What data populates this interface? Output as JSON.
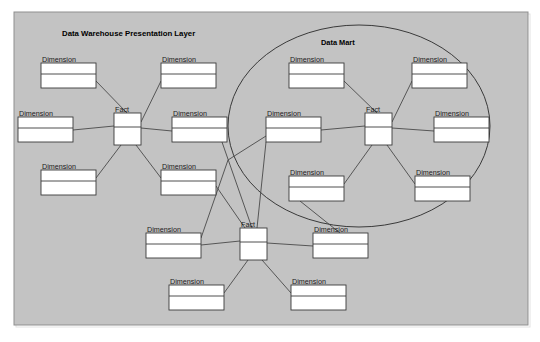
{
  "canvas": {
    "width": 540,
    "height": 342,
    "background": "#ffffff"
  },
  "panel": {
    "name": "data-warehouse-panel",
    "x": 14,
    "y": 12,
    "width": 514,
    "height": 313,
    "fill": "#c3c3c3",
    "stroke": "#8f8f8f"
  },
  "titles": {
    "warehouse": "Data Warehouse Presentation Layer",
    "warehouse_x": 62,
    "warehouse_y": 36,
    "mart": "Data Mart",
    "mart_x": 321,
    "mart_y": 45
  },
  "mart_ellipse": {
    "cx": 359,
    "cy": 126,
    "rx": 131,
    "ry": 101,
    "stroke": "#3a3a3a"
  },
  "entities": [
    {
      "id": "dim-nw-1",
      "label": "Dimension",
      "x": 41,
      "y": 63,
      "w": 55,
      "h": 25,
      "type": "dimension",
      "group": "warehouse-left"
    },
    {
      "id": "dim-nw-2",
      "label": "Dimension",
      "x": 161,
      "y": 63,
      "w": 55,
      "h": 25,
      "type": "dimension",
      "group": "warehouse-left"
    },
    {
      "id": "dim-w-1",
      "label": "Dimension",
      "x": 18,
      "y": 117,
      "w": 55,
      "h": 25,
      "type": "dimension",
      "group": "warehouse-left"
    },
    {
      "id": "dim-e-1",
      "label": "Dimension",
      "x": 172,
      "y": 117,
      "w": 55,
      "h": 25,
      "type": "dimension",
      "group": "warehouse-left"
    },
    {
      "id": "dim-sw-1",
      "label": "Dimension",
      "x": 41,
      "y": 170,
      "w": 55,
      "h": 25,
      "type": "dimension",
      "group": "warehouse-left"
    },
    {
      "id": "dim-sw-2",
      "label": "Dimension",
      "x": 161,
      "y": 170,
      "w": 55,
      "h": 25,
      "type": "dimension",
      "group": "warehouse-left"
    },
    {
      "id": "fact-left",
      "label": "Fact",
      "x": 114,
      "y": 113,
      "w": 27,
      "h": 32,
      "type": "fact",
      "group": "warehouse-left"
    },
    {
      "id": "dim-m-nw",
      "label": "Dimension",
      "x": 289,
      "y": 63,
      "w": 55,
      "h": 25,
      "type": "dimension",
      "group": "data-mart"
    },
    {
      "id": "dim-m-ne",
      "label": "Dimension",
      "x": 412,
      "y": 63,
      "w": 55,
      "h": 25,
      "type": "dimension",
      "group": "data-mart"
    },
    {
      "id": "dim-m-w",
      "label": "Dimension",
      "x": 266,
      "y": 117,
      "w": 55,
      "h": 25,
      "type": "dimension",
      "group": "data-mart"
    },
    {
      "id": "dim-m-e",
      "label": "Dimension",
      "x": 434,
      "y": 117,
      "w": 55,
      "h": 25,
      "type": "dimension",
      "group": "data-mart"
    },
    {
      "id": "dim-m-sw",
      "label": "Dimension",
      "x": 289,
      "y": 176,
      "w": 55,
      "h": 25,
      "type": "dimension",
      "group": "data-mart"
    },
    {
      "id": "dim-m-se",
      "label": "Dimension",
      "x": 415,
      "y": 176,
      "w": 55,
      "h": 25,
      "type": "dimension",
      "group": "data-mart"
    },
    {
      "id": "fact-mart",
      "label": "Fact",
      "x": 365,
      "y": 113,
      "w": 27,
      "h": 32,
      "type": "fact",
      "group": "data-mart"
    },
    {
      "id": "dim-b-w",
      "label": "Dimension",
      "x": 146,
      "y": 233,
      "w": 55,
      "h": 25,
      "type": "dimension",
      "group": "warehouse-bottom"
    },
    {
      "id": "dim-b-e",
      "label": "Dimension",
      "x": 313,
      "y": 233,
      "w": 55,
      "h": 25,
      "type": "dimension",
      "group": "warehouse-bottom"
    },
    {
      "id": "dim-b-sw",
      "label": "Dimension",
      "x": 169,
      "y": 285,
      "w": 55,
      "h": 25,
      "type": "dimension",
      "group": "warehouse-bottom"
    },
    {
      "id": "dim-b-se",
      "label": "Dimension",
      "x": 291,
      "y": 285,
      "w": 55,
      "h": 25,
      "type": "dimension",
      "group": "warehouse-bottom"
    },
    {
      "id": "fact-bottom",
      "label": "Fact",
      "x": 240,
      "y": 228,
      "w": 27,
      "h": 32,
      "type": "fact",
      "group": "warehouse-bottom"
    }
  ],
  "links": [
    {
      "id": "link-1",
      "from": "dim-nw-1",
      "to": "fact-left",
      "d": "M 96 81 L 127 113"
    },
    {
      "id": "link-2",
      "from": "dim-nw-2",
      "to": "fact-left",
      "d": "M 161 81 L 141 122"
    },
    {
      "id": "link-3",
      "from": "dim-w-1",
      "to": "fact-left",
      "d": "M 73 130 L 114 126"
    },
    {
      "id": "link-4",
      "from": "dim-e-1",
      "to": "fact-left",
      "d": "M 141 128 L 172 131"
    },
    {
      "id": "link-5",
      "from": "dim-sw-1",
      "to": "fact-left",
      "d": "M 96 178 L 121 145"
    },
    {
      "id": "link-6",
      "from": "dim-sw-2",
      "to": "fact-left",
      "d": "M 161 178 L 136 145"
    },
    {
      "id": "link-7",
      "from": "dim-m-nw",
      "to": "fact-mart",
      "d": "M 344 81 L 377 113"
    },
    {
      "id": "link-8",
      "from": "dim-m-ne",
      "to": "fact-mart",
      "d": "M 412 81 L 392 122"
    },
    {
      "id": "link-9",
      "from": "dim-m-w",
      "to": "fact-mart",
      "d": "M 321 130 L 365 126"
    },
    {
      "id": "link-10",
      "from": "dim-m-e",
      "to": "fact-mart",
      "d": "M 392 128 L 434 131"
    },
    {
      "id": "link-11",
      "from": "dim-m-sw",
      "to": "fact-mart",
      "d": "M 344 184 L 372 145"
    },
    {
      "id": "link-12",
      "from": "dim-m-se",
      "to": "fact-mart",
      "d": "M 415 184 L 387 145"
    },
    {
      "id": "link-13",
      "from": "dim-b-w",
      "to": "fact-bottom",
      "d": "M 201 245 L 240 241"
    },
    {
      "id": "link-14",
      "from": "dim-b-e",
      "to": "fact-bottom",
      "d": "M 267 243 L 313 246"
    },
    {
      "id": "link-15",
      "from": "dim-b-sw",
      "to": "fact-bottom",
      "d": "M 224 293 L 248 260"
    },
    {
      "id": "link-16",
      "from": "dim-b-se",
      "to": "fact-bottom",
      "d": "M 291 293 L 262 260"
    },
    {
      "id": "link-17",
      "from": "dim-e-1",
      "to": "fact-bottom",
      "d": "M 222 142 L 252 228"
    },
    {
      "id": "link-18",
      "from": "dim-m-w",
      "to": "fact-bottom",
      "d": "M 266 142 L 257 228"
    },
    {
      "id": "link-19",
      "from": "dim-m-sw",
      "to": "dim-b-e",
      "d": "M 300 201 L 340 233"
    },
    {
      "id": "link-20",
      "from": "dim-sw-2",
      "to": "fact-bottom",
      "d": "M 216 186 L 245 228"
    },
    {
      "id": "link-21",
      "from": "dim-m-w",
      "to": "dim-b-w",
      "d": "M 266 136 L 228 160 L 201 238"
    }
  ]
}
